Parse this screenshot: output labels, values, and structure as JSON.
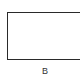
{
  "diagram": {
    "shape": {
      "type": "rectangle",
      "stroke_color": "#2a2a2a",
      "fill_color": "#ffffff"
    },
    "label": "B"
  }
}
